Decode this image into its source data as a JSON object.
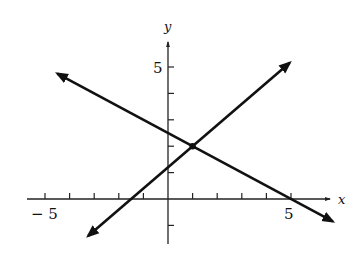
{
  "chart_data": {
    "type": "line",
    "title": "",
    "xlabel": "x",
    "ylabel": "y",
    "xlim": [
      -5.5,
      6.9
    ],
    "ylim": [
      -1.8,
      5.8
    ],
    "x_ticks": [
      -5,
      -4,
      -3,
      -2,
      -1,
      1,
      2,
      3,
      4,
      5
    ],
    "x_tick_labels": {
      "-5": "− 5",
      "5": "5"
    },
    "y_ticks": [
      -1,
      1,
      2,
      3,
      4,
      5
    ],
    "y_tick_labels": {
      "5": "5"
    },
    "grid": false,
    "legend": null,
    "series": [
      {
        "name": "decreasing line",
        "equation": "y = -0.5x + 2.5",
        "x": [
          -4.5,
          6.7
        ],
        "y": [
          4.75,
          -0.85
        ],
        "arrows": "both"
      },
      {
        "name": "increasing line",
        "equation": "y = 0.8x + 1.2",
        "x": [
          -3.25,
          4.95
        ],
        "y": [
          -1.4,
          5.16
        ],
        "arrows": "both"
      }
    ],
    "annotations": [
      {
        "type": "point",
        "x": 1,
        "y": 2,
        "label": "intersection"
      }
    ]
  },
  "axis": {
    "x_label": "x",
    "y_label": "y",
    "x_neg_label": "− 5",
    "x_pos_label": "5",
    "y_pos_label": "5"
  },
  "colors": {
    "line": "#111111",
    "axis": "#222222",
    "background": "#ffffff"
  }
}
